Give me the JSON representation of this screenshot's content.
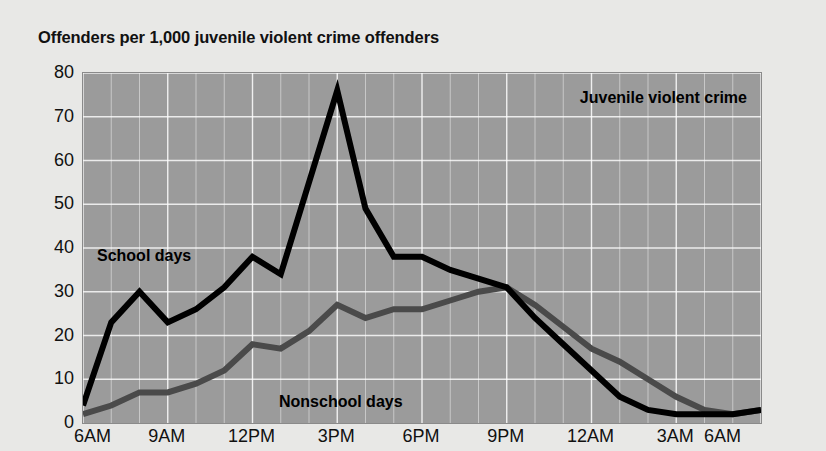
{
  "chart_data": {
    "type": "line",
    "title": "Offenders per 1,000 juvenile violent crime offenders",
    "xlabel": "",
    "ylabel": "",
    "ylim": [
      0,
      80
    ],
    "ytick_labels": [
      "80",
      "70",
      "60",
      "50",
      "40",
      "30",
      "20",
      "10",
      "0"
    ],
    "ytick_values": [
      80,
      70,
      60,
      50,
      40,
      30,
      20,
      10,
      0
    ],
    "xtick_labels": [
      "6AM",
      "9AM",
      "12PM",
      "3PM",
      "6PM",
      "9PM",
      "12AM",
      "3AM",
      "6AM"
    ],
    "xtick_values": [
      6,
      9,
      12,
      15,
      18,
      21,
      24,
      27,
      30
    ],
    "x": [
      6,
      7,
      8,
      9,
      10,
      11,
      12,
      13,
      14,
      15,
      16,
      17,
      18,
      19,
      20,
      21,
      22,
      23,
      24,
      25,
      26,
      27,
      28,
      29,
      30
    ],
    "grid": true,
    "grid_color": "#ffffff",
    "plot_background": "#9b9b9b",
    "page_background": "#e8e8e6",
    "legend_position": "in-plot annotations",
    "annotations": [
      {
        "text": "Juvenile violent crime",
        "position": "top-right"
      },
      {
        "text": "School days",
        "position": "upper-left"
      },
      {
        "text": "Nonschool days",
        "position": "lower-center"
      }
    ],
    "series": [
      {
        "name": "School days",
        "color": "#000000",
        "values": [
          4,
          23,
          30,
          23,
          26,
          31,
          38,
          34,
          55,
          76,
          49,
          38,
          38,
          35,
          33,
          31,
          24,
          18,
          12,
          6,
          3,
          2,
          2,
          2,
          3
        ]
      },
      {
        "name": "Nonschool days",
        "color": "#4a4a4a",
        "values": [
          2,
          4,
          7,
          7,
          9,
          12,
          18,
          17,
          21,
          27,
          24,
          26,
          26,
          28,
          30,
          31,
          27,
          22,
          17,
          14,
          10,
          6,
          3,
          2,
          3
        ]
      }
    ]
  }
}
